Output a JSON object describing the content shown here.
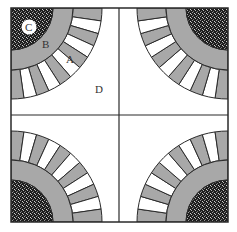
{
  "diagram": {
    "type": "quilt-block",
    "labels": {
      "C": "C",
      "B": "B",
      "A": "A",
      "D": "D"
    },
    "colors": {
      "background": "#ffffff",
      "outline": "#2a2a2a",
      "band_gray": "#a8a8a8",
      "segment_gray": "#a8a8a8",
      "segment_white": "#ffffff",
      "corner_dark": "#2c2c2c"
    },
    "geometry": {
      "square": {
        "x": 11,
        "y": 8,
        "w": 217,
        "h": 214
      },
      "center": {
        "x": 119,
        "y": 115
      },
      "radius_corner": 42,
      "radius_band_b": 62,
      "radius_band_a": 91,
      "segments_per_quadrant": 11
    }
  }
}
